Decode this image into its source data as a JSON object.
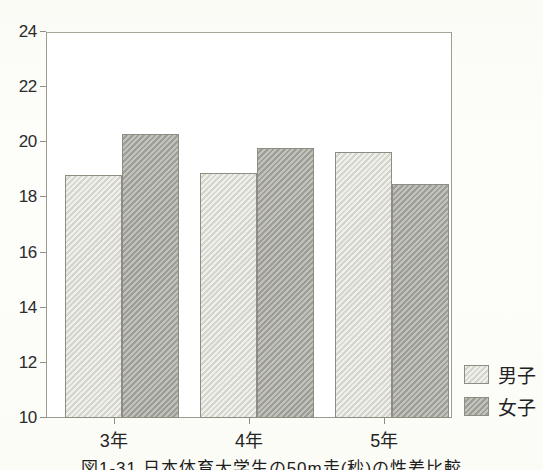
{
  "chart_data": {
    "type": "bar",
    "title": "",
    "subtitle": "",
    "xlabel": "",
    "ylabel": "",
    "categories": [
      "3年",
      "4年",
      "5年"
    ],
    "series": [
      {
        "name": "男子",
        "values": [
          18.8,
          18.9,
          19.65
        ],
        "color": "#dcdcd4"
      },
      {
        "name": "女子",
        "values": [
          20.3,
          19.8,
          18.5
        ],
        "color": "#a8a8a0"
      }
    ],
    "ylim": [
      10,
      24
    ],
    "yticks": [
      10,
      12,
      14,
      16,
      18,
      20,
      22,
      24
    ],
    "ytick_labels": [
      "10",
      "12",
      "14",
      "16",
      "18",
      "20",
      "22",
      "24"
    ],
    "grid": false,
    "legend_position": "right",
    "frame": true
  },
  "legend": {
    "entries": [
      {
        "label": "男子",
        "swatch": "male"
      },
      {
        "label": "女子",
        "swatch": "female"
      }
    ]
  },
  "caption": {
    "text": "図1-31 日本体育大学生の50m走(秒)の性差比較"
  },
  "colors": {
    "male_fill": "#dcdcd4",
    "female_fill": "#a8a8a0",
    "bar_outline": "#8d8d82",
    "axis": "#9b9b90",
    "text": "#222222",
    "plot_background": "#ffffff",
    "page_background": "#fcfcf8"
  }
}
